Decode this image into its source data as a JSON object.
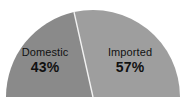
{
  "chart_data": {
    "type": "pie",
    "variant": "half-pie",
    "title": "",
    "subtitle": "",
    "xlabel": "",
    "ylabel": "",
    "legend": "none",
    "grid": false,
    "total": 100,
    "unit": "%",
    "start_angle_deg": 180,
    "sweep_deg": 180,
    "categories": [
      "Domestic",
      "Imported"
    ],
    "values": [
      43,
      57
    ],
    "value_labels": [
      "43%",
      "57%"
    ],
    "colors": [
      "#8a8a8a",
      "#9e9e9e"
    ],
    "slices": [
      {
        "label": "Domestic",
        "value": 43,
        "value_label": "43%",
        "color": "#8a8a8a",
        "side": "left"
      },
      {
        "label": "Imported",
        "value": 57,
        "value_label": "57%",
        "color": "#9e9e9e",
        "side": "right"
      }
    ],
    "divider_color": "#f2f2f2",
    "background_color": "#ffffff",
    "label_color": "#111111"
  },
  "slice_left": {
    "name": "Domestic",
    "percent": "43%"
  },
  "slice_right": {
    "name": "Imported",
    "percent": "57%"
  }
}
